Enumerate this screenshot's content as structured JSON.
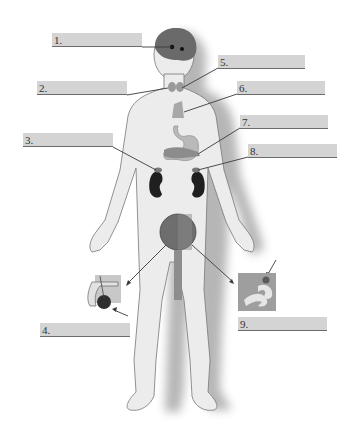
{
  "diagram": {
    "colors": {
      "label_fill": "#d4d4d4",
      "label_underline": "#6b6b6b",
      "skin": "#ececec",
      "shadow": "#9a9a9a",
      "organ_dark": "#2a2a2a",
      "brain": "#6a6a6a"
    },
    "labels": [
      {
        "id": "1",
        "text": "1.",
        "points_to": "pituitary / pineal (brain)",
        "x": 52,
        "y": 33,
        "w": 90
      },
      {
        "id": "2",
        "text": "2.",
        "points_to": "thyroid / parathyroid",
        "x": 37,
        "y": 81,
        "w": 90
      },
      {
        "id": "3",
        "text": "3.",
        "points_to": "adrenal gland (left)",
        "x": 23,
        "y": 133,
        "w": 90
      },
      {
        "id": "4",
        "text": "4.",
        "points_to": "testis (inset)",
        "x": 40,
        "y": 323,
        "w": 90
      },
      {
        "id": "5",
        "text": "5.",
        "points_to": "thyroid",
        "x": 218,
        "y": 55,
        "w": 87
      },
      {
        "id": "6",
        "text": "6.",
        "points_to": "thymus",
        "x": 237,
        "y": 81,
        "w": 88
      },
      {
        "id": "7",
        "text": "7.",
        "points_to": "pancreas",
        "x": 240,
        "y": 115,
        "w": 88
      },
      {
        "id": "8",
        "text": "8.",
        "points_to": "adrenal gland (right)",
        "x": 248,
        "y": 144,
        "w": 89
      },
      {
        "id": "9",
        "text": "9.",
        "points_to": "ovary (inset)",
        "x": 238,
        "y": 317,
        "w": 89
      }
    ],
    "insets": [
      {
        "name": "male-reproductive-inset",
        "x": 83,
        "y": 275
      },
      {
        "name": "female-reproductive-inset",
        "x": 238,
        "y": 273
      }
    ]
  }
}
